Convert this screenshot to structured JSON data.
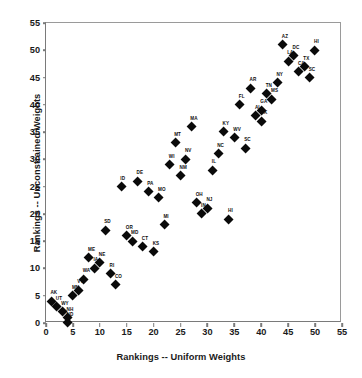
{
  "chart_data": {
    "type": "scatter",
    "title": "",
    "xlabel": "Rankings -- Uniform Weights",
    "ylabel": "Rankings -- Unconstrained Weights",
    "xlim": [
      0,
      55
    ],
    "ylim": [
      0,
      55
    ],
    "xticks": [
      0,
      5,
      10,
      15,
      20,
      25,
      30,
      35,
      40,
      45,
      50,
      55
    ],
    "yticks": [
      0,
      5,
      10,
      15,
      20,
      25,
      30,
      35,
      40,
      45,
      50,
      55
    ],
    "grid": false,
    "legend": "none",
    "marker": "filled-diamond",
    "marker_color": "#0a0a0a",
    "axis_color": "#7a7a7a",
    "point_label_position": "above-left",
    "points": [
      {
        "label": "AK",
        "x": 1,
        "y": 4
      },
      {
        "label": "UT",
        "x": 2,
        "y": 3
      },
      {
        "label": "WY",
        "x": 3,
        "y": 2
      },
      {
        "label": "NH",
        "x": 4,
        "y": 1
      },
      {
        "label": "ND",
        "x": 4,
        "y": 0
      },
      {
        "label": "MN",
        "x": 5,
        "y": 5
      },
      {
        "label": "VT",
        "x": 6,
        "y": 6
      },
      {
        "label": "WA",
        "x": 7,
        "y": 8
      },
      {
        "label": "ME",
        "x": 8,
        "y": 12
      },
      {
        "label": "IA",
        "x": 9,
        "y": 10
      },
      {
        "label": "NE",
        "x": 10,
        "y": 11
      },
      {
        "label": "SD",
        "x": 11,
        "y": 17
      },
      {
        "label": "RI",
        "x": 12,
        "y": 9
      },
      {
        "label": "CO",
        "x": 13,
        "y": 7
      },
      {
        "label": "ID",
        "x": 14,
        "y": 25
      },
      {
        "label": "OR",
        "x": 15,
        "y": 16
      },
      {
        "label": "MD",
        "x": 16,
        "y": 15
      },
      {
        "label": "DE",
        "x": 17,
        "y": 26
      },
      {
        "label": "CT",
        "x": 18,
        "y": 14
      },
      {
        "label": "PA",
        "x": 19,
        "y": 24
      },
      {
        "label": "KS",
        "x": 20,
        "y": 13
      },
      {
        "label": "MO",
        "x": 21,
        "y": 23
      },
      {
        "label": "MI",
        "x": 22,
        "y": 18
      },
      {
        "label": "WI",
        "x": 23,
        "y": 29
      },
      {
        "label": "MT",
        "x": 24,
        "y": 33
      },
      {
        "label": "NM",
        "x": 25,
        "y": 27
      },
      {
        "label": "NV",
        "x": 26,
        "y": 30
      },
      {
        "label": "MA",
        "x": 27,
        "y": 36
      },
      {
        "label": "OH",
        "x": 28,
        "y": 22
      },
      {
        "label": "IN",
        "x": 29,
        "y": 20
      },
      {
        "label": "NJ",
        "x": 30,
        "y": 21
      },
      {
        "label": "IL",
        "x": 31,
        "y": 28
      },
      {
        "label": "NC",
        "x": 32,
        "y": 31
      },
      {
        "label": "KY",
        "x": 33,
        "y": 35
      },
      {
        "label": "HI",
        "x": 34,
        "y": 19
      },
      {
        "label": "WV",
        "x": 35,
        "y": 34
      },
      {
        "label": "FL",
        "x": 36,
        "y": 40
      },
      {
        "label": "SC",
        "x": 37,
        "y": 32
      },
      {
        "label": "AR",
        "x": 38,
        "y": 43
      },
      {
        "label": "AL",
        "x": 39,
        "y": 38
      },
      {
        "label": "GA",
        "x": 40,
        "y": 39
      },
      {
        "label": "OK",
        "x": 40,
        "y": 37
      },
      {
        "label": "TN",
        "x": 41,
        "y": 42
      },
      {
        "label": "MS",
        "x": 42,
        "y": 41
      },
      {
        "label": "NY",
        "x": 43,
        "y": 44
      },
      {
        "label": "AZ",
        "x": 44,
        "y": 51
      },
      {
        "label": "LA",
        "x": 45,
        "y": 48
      },
      {
        "label": "DC",
        "x": 46,
        "y": 49
      },
      {
        "label": "CA",
        "x": 47,
        "y": 46
      },
      {
        "label": "TX",
        "x": 48,
        "y": 47
      },
      {
        "label": "SC2",
        "x": 49,
        "y": 45
      },
      {
        "label": "HI2",
        "x": 50,
        "y": 50
      }
    ]
  }
}
